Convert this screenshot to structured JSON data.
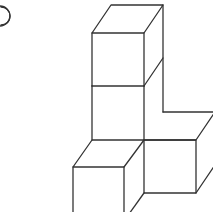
{
  "figure": {
    "label_marker": "circled-number-partial",
    "cube_count": 5,
    "stroke_color": "#333333",
    "background": "#ffffff"
  }
}
